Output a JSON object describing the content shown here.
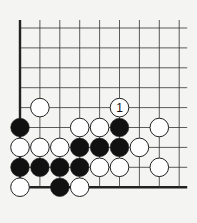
{
  "board": {
    "origin_x": 20,
    "origin_y": 28,
    "spacing": 19.9,
    "cols": 9,
    "rows": 9,
    "line_color": "#333333",
    "edge_color": "#222222",
    "background": "#f4f4f2",
    "stone_radius": 9.3,
    "edges": [
      "left",
      "bottom"
    ]
  },
  "stones": [
    {
      "color": "white",
      "col": 1,
      "row": 4
    },
    {
      "color": "white",
      "col": 5,
      "row": 4,
      "label": "1"
    },
    {
      "color": "black",
      "col": 0,
      "row": 5
    },
    {
      "color": "white",
      "col": 3,
      "row": 5
    },
    {
      "color": "white",
      "col": 4,
      "row": 5
    },
    {
      "color": "black",
      "col": 5,
      "row": 5
    },
    {
      "color": "white",
      "col": 7,
      "row": 5
    },
    {
      "color": "white",
      "col": 0,
      "row": 6
    },
    {
      "color": "white",
      "col": 1,
      "row": 6
    },
    {
      "color": "white",
      "col": 2,
      "row": 6
    },
    {
      "color": "black",
      "col": 3,
      "row": 6
    },
    {
      "color": "black",
      "col": 4,
      "row": 6
    },
    {
      "color": "black",
      "col": 5,
      "row": 6
    },
    {
      "color": "white",
      "col": 6,
      "row": 6
    },
    {
      "color": "black",
      "col": 0,
      "row": 7
    },
    {
      "color": "black",
      "col": 1,
      "row": 7
    },
    {
      "color": "black",
      "col": 2,
      "row": 7
    },
    {
      "color": "black",
      "col": 3,
      "row": 7
    },
    {
      "color": "white",
      "col": 4,
      "row": 7
    },
    {
      "color": "white",
      "col": 5,
      "row": 7
    },
    {
      "color": "white",
      "col": 7,
      "row": 7
    },
    {
      "color": "white",
      "col": 0,
      "row": 8
    },
    {
      "color": "black",
      "col": 2,
      "row": 8
    },
    {
      "color": "white",
      "col": 3,
      "row": 8
    }
  ],
  "labels": {
    "move_1": "1"
  }
}
